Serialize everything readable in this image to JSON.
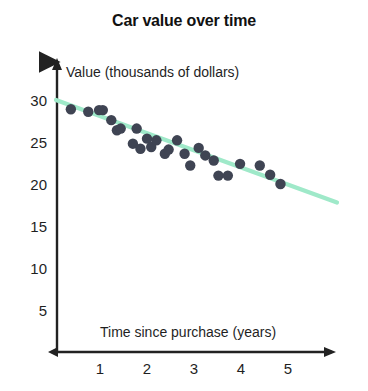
{
  "chart_data": {
    "type": "scatter",
    "title": "Car value over time",
    "xlabel": "Time since purchase (years)",
    "ylabel": "Value (thousands of dollars)",
    "xlim": [
      0,
      5.8
    ],
    "ylim": [
      0,
      31
    ],
    "grid": false,
    "legend": null,
    "xticks": [
      1,
      2,
      3,
      4,
      5
    ],
    "xtick_labels": [
      "1",
      "2",
      "3",
      "4",
      "5"
    ],
    "yticks": [
      5,
      10,
      15,
      20,
      25,
      30
    ],
    "ytick_labels": [
      "5",
      "10",
      "15",
      "20",
      "25",
      "30"
    ],
    "point_color": "#3f4453",
    "line_color": "#9fe9c9",
    "axis_color": "#222222",
    "series": [
      {
        "name": "Car value observations",
        "marker": "circle",
        "x": [
          0.38,
          0.75,
          0.98,
          1.06,
          1.24,
          1.36,
          1.44,
          1.7,
          1.78,
          1.86,
          2.0,
          2.09,
          2.2,
          2.38,
          2.46,
          2.64,
          2.8,
          2.92,
          3.1,
          3.24,
          3.42,
          3.52,
          3.72,
          3.98,
          4.4,
          4.62,
          4.84
        ],
        "y": [
          28.9,
          28.6,
          28.8,
          28.8,
          27.6,
          26.4,
          26.6,
          24.8,
          26.6,
          24.2,
          25.4,
          24.4,
          25.2,
          23.6,
          24.1,
          25.2,
          23.6,
          22.2,
          24.3,
          23.4,
          22.8,
          21.0,
          21.0,
          22.4,
          22.2,
          21.1,
          20.0
        ]
      }
    ],
    "trend_line": {
      "name": "line of best fit",
      "x_start": 0.0,
      "y_start": 30.0,
      "x_end": 6.0,
      "y_end": 17.8
    }
  }
}
